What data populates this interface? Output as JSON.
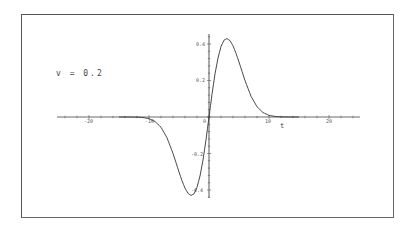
{
  "chart_data": {
    "type": "line",
    "title": "",
    "xlabel": "t",
    "ylabel": "",
    "annotation": "v = 0.2",
    "xlim": [
      -27,
      29
    ],
    "ylim": [
      -0.48,
      0.46
    ],
    "grid": false,
    "legend": null,
    "x_ticks": [
      -20,
      -10,
      0,
      10,
      20
    ],
    "x_tick_labels": [
      "-20",
      "-10",
      "0",
      "10",
      "20"
    ],
    "y_ticks": [
      -0.4,
      -0.2,
      0.2,
      0.4
    ],
    "y_tick_labels": [
      "-0.4",
      "-0.2",
      "0.2",
      "0.4"
    ],
    "series": [
      {
        "name": "v = 0.2",
        "color": "#333333",
        "x": [
          -15,
          -13,
          -12,
          -11,
          -10,
          -9,
          -8,
          -7,
          -6,
          -5.5,
          -5,
          -4.5,
          -4,
          -3.5,
          -3,
          -2.5,
          -2,
          -1.5,
          -1,
          -0.5,
          0,
          0.5,
          1,
          1.5,
          2,
          2.5,
          3,
          3.5,
          4,
          4.5,
          5,
          5.5,
          6,
          7,
          8,
          9,
          10,
          11,
          12,
          13,
          15
        ],
        "y": [
          0,
          -0.0001,
          -0.0005,
          -0.0018,
          -0.0055,
          -0.0147,
          -0.0338,
          -0.0685,
          -0.1203,
          -0.1507,
          -0.1814,
          -0.2104,
          -0.2349,
          -0.252,
          -0.259,
          -0.2536,
          -0.2323,
          -0.1947,
          -0.1422,
          -0.0748,
          0,
          0.0748,
          0.1422,
          0.1947,
          0.2323,
          0.2536,
          0.259,
          0.252,
          0.2349,
          0.2104,
          0.1814,
          0.1507,
          0.1203,
          0.0685,
          0.0338,
          0.0147,
          0.0055,
          0.0018,
          0.0005,
          0.0001,
          0
        ],
        "scale": 1.66
      }
    ]
  },
  "labels": {
    "annotation": "v = 0.2",
    "xlabel": "t",
    "xt_m20": "-20",
    "xt_m10": "-10",
    "xt_0": "0",
    "xt_10": "10",
    "xt_20": "20",
    "yt_04": "0.4",
    "yt_02": "0.2",
    "yt_m02": "-0.2",
    "yt_m04": "-0.4"
  }
}
